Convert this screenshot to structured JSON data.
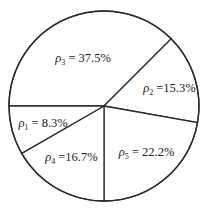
{
  "chart_data": {
    "type": "pie",
    "title": "",
    "start_direction": "left",
    "direction": "clockwise",
    "slices": [
      {
        "symbol": "ρ",
        "subscript": "3",
        "label": "ρ3 = 37.5%",
        "value": 37.5,
        "display": " = 37.5%"
      },
      {
        "symbol": "ρ",
        "subscript": "2",
        "label": "ρ2 = 15.3%",
        "value": 15.3,
        "display": " =15.3%"
      },
      {
        "symbol": "ρ",
        "subscript": "5",
        "label": "ρ5 = 22.2%",
        "value": 22.2,
        "display": " = 22.2%"
      },
      {
        "symbol": "ρ",
        "subscript": "4",
        "label": "ρ4 = 16.7%",
        "value": 16.7,
        "display": " =16.7%"
      },
      {
        "symbol": "ρ",
        "subscript": "1",
        "label": "ρ1 = 8.3%",
        "value": 8.3,
        "display": " = 8.3%"
      }
    ],
    "legend": "none",
    "colors": {
      "fill": "#ffffff",
      "stroke": "#2b2b2b",
      "text": "#1a1a1a"
    }
  }
}
